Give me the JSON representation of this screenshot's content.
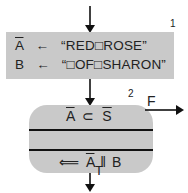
{
  "diagram": {
    "box1": {
      "number": "1",
      "row1": {
        "var": "A",
        "var_overline": true,
        "arrow": "←",
        "value": "“RED□ROSE”"
      },
      "row2": {
        "var": "B",
        "var_overline": false,
        "arrow": "←",
        "value": "“□OF□SHARON”"
      }
    },
    "box2": {
      "number": "2",
      "top_text": {
        "left": "A",
        "op": "⊂",
        "right": "S"
      },
      "bottom_text": {
        "arrow": "⟸",
        "left": "A",
        "op": "‖",
        "right": "B"
      },
      "exit_false": "F",
      "exit_true": "T"
    },
    "colors": {
      "box_fill": "#c9c9c9",
      "line": "#111111"
    }
  }
}
